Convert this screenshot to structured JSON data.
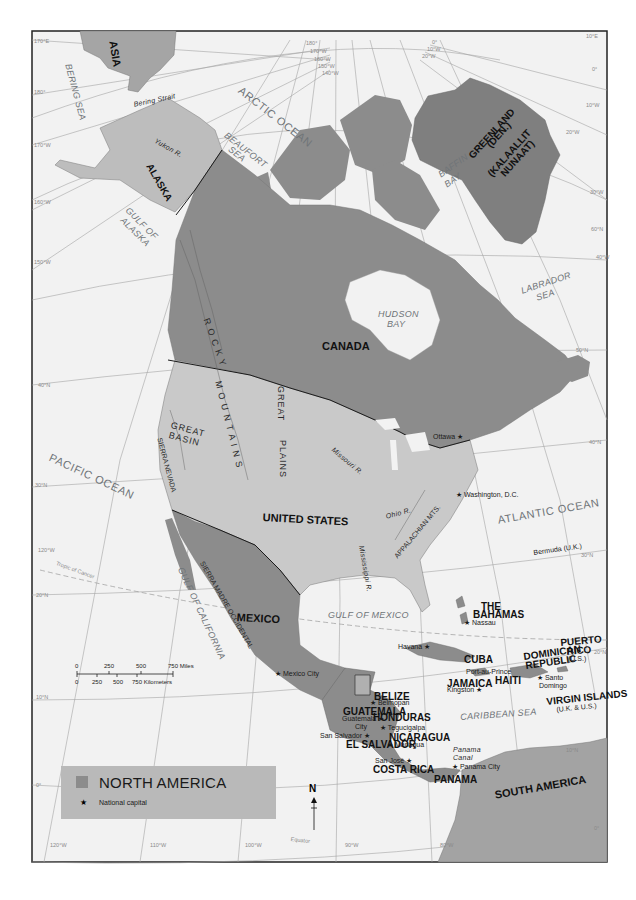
{
  "map": {
    "title": "NORTH AMERICA",
    "frame": {
      "x": 32,
      "y": 31,
      "width": 244,
      "height": 0
    },
    "colors": {
      "north_america": "#8c8c8c",
      "usa": "#c9c9c9",
      "alaska": "#bdbdbd",
      "greenland": "#7f7f7f",
      "asia": "#a5a5a5",
      "south_america": "#a3a3a3",
      "ocean": "#f2f2f2",
      "border": "#1a1a1a",
      "graticule": "#9a9a9a",
      "legend_bg": "#b9b9b9"
    }
  },
  "labels": {
    "countries": [
      {
        "id": "asia",
        "text": "ASIA",
        "x": 118,
        "y": 40,
        "rot": 80,
        "cls": "country big"
      },
      {
        "id": "alaska",
        "text": "ALASKA",
        "x": 153,
        "y": 162,
        "rot": 60,
        "cls": "country"
      },
      {
        "id": "greenland",
        "text": "GREENLAND",
        "x": 467,
        "y": 154,
        "rot": -48,
        "cls": "country"
      },
      {
        "id": "greenland-den",
        "text": "(DEN.)",
        "x": 485,
        "y": 143,
        "rot": -48,
        "cls": "country"
      },
      {
        "id": "kalaallit",
        "text": "(KALAALLIT",
        "x": 486,
        "y": 172,
        "rot": -48,
        "cls": "country"
      },
      {
        "id": "nunaat",
        "text": "NUNAAT)",
        "x": 499,
        "y": 172,
        "rot": -48,
        "cls": "country"
      },
      {
        "id": "canada",
        "text": "CANADA",
        "x": 322,
        "y": 341,
        "rot": 0,
        "cls": "country big"
      },
      {
        "id": "united-states",
        "text": "UNITED STATES",
        "x": 263,
        "y": 512,
        "rot": 3,
        "cls": "country big"
      },
      {
        "id": "mexico",
        "text": "MEXICO",
        "x": 237,
        "y": 612,
        "rot": 3,
        "cls": "country big"
      },
      {
        "id": "the-bahamas-1",
        "text": "THE",
        "x": 481,
        "y": 602,
        "rot": 0,
        "cls": "country"
      },
      {
        "id": "the-bahamas-2",
        "text": "BAHAMAS",
        "x": 473,
        "y": 610,
        "rot": 0,
        "cls": "country"
      },
      {
        "id": "cuba",
        "text": "CUBA",
        "x": 464,
        "y": 655,
        "rot": 0,
        "cls": "country"
      },
      {
        "id": "jamaica",
        "text": "JAMAICA",
        "x": 447,
        "y": 679,
        "rot": 0,
        "cls": "country"
      },
      {
        "id": "haiti",
        "text": "HAITI",
        "x": 495,
        "y": 676,
        "rot": 0,
        "cls": "country"
      },
      {
        "id": "dominican-republic-1",
        "text": "DOMINICAN",
        "x": 523,
        "y": 652,
        "rot": -8,
        "cls": "country"
      },
      {
        "id": "dominican-republic-2",
        "text": "REPUBLIC",
        "x": 525,
        "y": 661,
        "rot": -8,
        "cls": "country"
      },
      {
        "id": "puerto-rico-1",
        "text": "PUERTO",
        "x": 560,
        "y": 638,
        "rot": -5,
        "cls": "country"
      },
      {
        "id": "puerto-rico-2",
        "text": "RICO",
        "x": 566,
        "y": 647,
        "rot": -5,
        "cls": "country"
      },
      {
        "id": "virgin-islands",
        "text": "VIRGIN ISLANDS",
        "x": 546,
        "y": 697,
        "rot": -6,
        "cls": "country"
      },
      {
        "id": "belize",
        "text": "BELIZE",
        "x": 374,
        "y": 692,
        "rot": 0,
        "cls": "country"
      },
      {
        "id": "guatemala",
        "text": "GUATEMALA",
        "x": 343,
        "y": 707,
        "rot": 0,
        "cls": "country"
      },
      {
        "id": "honduras",
        "text": "HONDURAS",
        "x": 373,
        "y": 713,
        "rot": 0,
        "cls": "country"
      },
      {
        "id": "el-salvador",
        "text": "EL SALVADOR",
        "x": 346,
        "y": 740,
        "rot": 0,
        "cls": "country"
      },
      {
        "id": "nicaragua",
        "text": "NICARAGUA",
        "x": 389,
        "y": 733,
        "rot": 0,
        "cls": "country"
      },
      {
        "id": "costa-rica",
        "text": "COSTA RICA",
        "x": 373,
        "y": 765,
        "rot": 0,
        "cls": "country"
      },
      {
        "id": "panama",
        "text": "PANAMA",
        "x": 434,
        "y": 775,
        "rot": 0,
        "cls": "country"
      },
      {
        "id": "south-america",
        "text": "SOUTH AMERICA",
        "x": 494,
        "y": 790,
        "rot": -10,
        "cls": "country big"
      }
    ],
    "water": [
      {
        "id": "bering-sea",
        "text": "BERING SEA",
        "x": 72,
        "y": 63,
        "rot": 75,
        "cls": "ocean"
      },
      {
        "id": "bering-strait",
        "text": "Bering Strait",
        "x": 133,
        "y": 101,
        "rot": -12,
        "cls": "ocean feature-sm"
      },
      {
        "id": "arctic-ocean",
        "text": "ARCTIC OCEAN",
        "x": 243,
        "y": 85,
        "rot": 38,
        "cls": "ocean-big"
      },
      {
        "id": "beaufort-sea-1",
        "text": "BEAUFORT",
        "x": 228,
        "y": 131,
        "rot": 38,
        "cls": "ocean"
      },
      {
        "id": "beaufort-sea-2",
        "text": "SEA",
        "x": 232,
        "y": 145,
        "rot": 38,
        "cls": "ocean"
      },
      {
        "id": "gulf-of-alaska-1",
        "text": "GULF OF",
        "x": 130,
        "y": 206,
        "rot": 45,
        "cls": "ocean"
      },
      {
        "id": "gulf-of-alaska-2",
        "text": "ALASKA",
        "x": 125,
        "y": 216,
        "rot": 45,
        "cls": "ocean"
      },
      {
        "id": "baffin-bay-1",
        "text": "BAFFIN",
        "x": 437,
        "y": 172,
        "rot": -35,
        "cls": "ocean"
      },
      {
        "id": "baffin-bay-2",
        "text": "BAY",
        "x": 443,
        "y": 182,
        "rot": -35,
        "cls": "ocean"
      },
      {
        "id": "hudson-bay-1",
        "text": "HUDSON",
        "x": 378,
        "y": 310,
        "rot": 0,
        "cls": "ocean"
      },
      {
        "id": "hudson-bay-2",
        "text": "BAY",
        "x": 387,
        "y": 320,
        "rot": 0,
        "cls": "ocean"
      },
      {
        "id": "labrador-sea-1",
        "text": "LABRADOR",
        "x": 520,
        "y": 287,
        "rot": -18,
        "cls": "ocean"
      },
      {
        "id": "labrador-sea-2",
        "text": "SEA",
        "x": 535,
        "y": 294,
        "rot": -18,
        "cls": "ocean"
      },
      {
        "id": "pacific-ocean",
        "text": "PACIFIC OCEAN",
        "x": 52,
        "y": 452,
        "rot": 25,
        "cls": "ocean-big"
      },
      {
        "id": "atlantic-ocean",
        "text": "ATLANTIC OCEAN",
        "x": 497,
        "y": 515,
        "rot": -10,
        "cls": "ocean-big"
      },
      {
        "id": "gulf-of-mexico",
        "text": "GULF OF MEXICO",
        "x": 328,
        "y": 611,
        "rot": 0,
        "cls": "ocean"
      },
      {
        "id": "gulf-of-california",
        "text": "GULF OF CALIFORNIA",
        "x": 184,
        "y": 566,
        "rot": 65,
        "cls": "ocean"
      },
      {
        "id": "caribbean-sea",
        "text": "CARIBBEAN SEA",
        "x": 460,
        "y": 713,
        "rot": -4,
        "cls": "ocean"
      },
      {
        "id": "panama-canal-1",
        "text": "Panama",
        "x": 453,
        "y": 746,
        "rot": 0,
        "cls": "ocean feature-sm"
      },
      {
        "id": "panama-canal-2",
        "text": "Canal",
        "x": 453,
        "y": 754,
        "rot": 0,
        "cls": "ocean feature-sm"
      }
    ],
    "features": [
      {
        "id": "rocky-mountains-1",
        "text": "R O C K Y",
        "x": 210,
        "y": 317,
        "rot": 70,
        "cls": "feature"
      },
      {
        "id": "rocky-mountains-2",
        "text": "M O U N T A I N S",
        "x": 222,
        "y": 380,
        "rot": 76,
        "cls": "feature"
      },
      {
        "id": "great-plains-1",
        "text": "GREAT",
        "x": 285,
        "y": 386,
        "rot": 90,
        "cls": "feature"
      },
      {
        "id": "great-plains-2",
        "text": "PLAINS",
        "x": 287,
        "y": 440,
        "rot": 90,
        "cls": "feature"
      },
      {
        "id": "great-basin-1",
        "text": "GREAT",
        "x": 172,
        "y": 421,
        "rot": 15,
        "cls": "feature"
      },
      {
        "id": "great-basin-2",
        "text": "BASIN",
        "x": 170,
        "y": 431,
        "rot": 15,
        "cls": "feature"
      },
      {
        "id": "sierra-nevada",
        "text": "SIERRA NEVADA",
        "x": 163,
        "y": 437,
        "rot": 75,
        "cls": "feature-sm"
      },
      {
        "id": "sierra-madre",
        "text": "SIERRA MADRE OCCIDENTAL",
        "x": 205,
        "y": 560,
        "rot": 60,
        "cls": "feature-sm"
      },
      {
        "id": "appalachian",
        "text": "APPALACHIAN MTS.",
        "x": 393,
        "y": 555,
        "rot": -50,
        "cls": "feature-sm"
      },
      {
        "id": "ohio-river",
        "text": "Ohio R.",
        "x": 385,
        "y": 513,
        "rot": -15,
        "cls": "ocean feature-sm"
      },
      {
        "id": "missouri-river",
        "text": "Missouri R.",
        "x": 335,
        "y": 446,
        "rot": 40,
        "cls": "ocean feature-sm"
      },
      {
        "id": "mississippi-river",
        "text": "Mississippi R.",
        "x": 365,
        "y": 545,
        "rot": 80,
        "cls": "ocean feature-sm"
      },
      {
        "id": "yukon-river",
        "text": "Yukon R.",
        "x": 157,
        "y": 137,
        "rot": 30,
        "cls": "ocean feature-sm"
      },
      {
        "id": "tropic-of-cancer",
        "text": "Tropic of Cancer",
        "x": 57,
        "y": 561,
        "rot": 20,
        "cls": "grid"
      },
      {
        "id": "equator",
        "text": "Equator",
        "x": 291,
        "y": 837,
        "rot": 6,
        "cls": "grid"
      }
    ],
    "cities": [
      {
        "id": "ottawa",
        "text": "Ottawa ★",
        "x": 433,
        "y": 433,
        "rot": 0
      },
      {
        "id": "washington",
        "text": "★ Washington, D.C.",
        "x": 456,
        "y": 491,
        "rot": 0
      },
      {
        "id": "bermuda",
        "text": "Bermuda (U.K.)",
        "x": 533,
        "y": 549,
        "rot": -8
      },
      {
        "id": "nassau",
        "text": "★ Nassau",
        "x": 464,
        "y": 619,
        "rot": 0
      },
      {
        "id": "havana",
        "text": "Havana ★",
        "x": 398,
        "y": 643,
        "rot": 0
      },
      {
        "id": "port-au-prince",
        "text": "Port-au-Prince",
        "x": 466,
        "y": 668,
        "rot": 0
      },
      {
        "id": "kingston",
        "text": "Kingston ★",
        "x": 447,
        "y": 686,
        "rot": 0
      },
      {
        "id": "santo-domingo-1",
        "text": "★ Santo",
        "x": 537,
        "y": 674,
        "rot": 0
      },
      {
        "id": "santo-domingo-2",
        "text": "Domingo",
        "x": 539,
        "y": 682,
        "rot": 0
      },
      {
        "id": "puerto-rico-us",
        "text": "(U.S.)",
        "x": 568,
        "y": 655,
        "rot": 0
      },
      {
        "id": "virgin-islands-us",
        "text": "(U.K. & U.S.)",
        "x": 556,
        "y": 706,
        "rot": -6
      },
      {
        "id": "mexico-city",
        "text": "★ Mexico City",
        "x": 275,
        "y": 670,
        "rot": 0
      },
      {
        "id": "belmopan",
        "text": "★ Belmopan",
        "x": 370,
        "y": 699,
        "rot": 0
      },
      {
        "id": "guatemala-city-1",
        "text": "Guatemala ★",
        "x": 342,
        "y": 715,
        "rot": 0
      },
      {
        "id": "guatemala-city-2",
        "text": "City",
        "x": 355,
        "y": 723,
        "rot": 0
      },
      {
        "id": "tegucigalpa",
        "text": "★ Tegucigalpa",
        "x": 380,
        "y": 724,
        "rot": 0
      },
      {
        "id": "san-salvador",
        "text": "San Salvador ★",
        "x": 320,
        "y": 732,
        "rot": 0
      },
      {
        "id": "managua",
        "text": "★ Managua",
        "x": 387,
        "y": 741,
        "rot": 0
      },
      {
        "id": "san-jose",
        "text": "San José ★",
        "x": 375,
        "y": 757,
        "rot": 0
      },
      {
        "id": "panama-city",
        "text": "★ Panama City",
        "x": 452,
        "y": 763,
        "rot": 0
      }
    ],
    "graticule_marks": [
      {
        "text": "170°E",
        "x": 34,
        "y": 39
      },
      {
        "text": "180°",
        "x": 34,
        "y": 90
      },
      {
        "text": "170°W",
        "x": 34,
        "y": 143
      },
      {
        "text": "160°W",
        "x": 34,
        "y": 200
      },
      {
        "text": "150°W",
        "x": 34,
        "y": 260
      },
      {
        "text": "40°N",
        "x": 38,
        "y": 383
      },
      {
        "text": "30°N",
        "x": 35,
        "y": 483
      },
      {
        "text": "120°W",
        "x": 38,
        "y": 548
      },
      {
        "text": "20°N",
        "x": 36,
        "y": 593
      },
      {
        "text": "10°N",
        "x": 36,
        "y": 695
      },
      {
        "text": "0°",
        "x": 36,
        "y": 783
      },
      {
        "text": "120°W",
        "x": 50,
        "y": 843
      },
      {
        "text": "110°W",
        "x": 150,
        "y": 843
      },
      {
        "text": "100°W",
        "x": 245,
        "y": 843
      },
      {
        "text": "90°W",
        "x": 345,
        "y": 843
      },
      {
        "text": "80°W",
        "x": 440,
        "y": 843
      },
      {
        "text": "180°",
        "x": 306,
        "y": 41
      },
      {
        "text": "170°W",
        "x": 310,
        "y": 49
      },
      {
        "text": "160°W",
        "x": 314,
        "y": 57
      },
      {
        "text": "150°W",
        "x": 318,
        "y": 64
      },
      {
        "text": "140°W",
        "x": 322,
        "y": 71
      },
      {
        "text": "0°",
        "x": 432,
        "y": 40
      },
      {
        "text": "10°W",
        "x": 427,
        "y": 47
      },
      {
        "text": "20°W",
        "x": 422,
        "y": 54
      },
      {
        "text": "10°E",
        "x": 586,
        "y": 34
      },
      {
        "text": "0°",
        "x": 592,
        "y": 67
      },
      {
        "text": "10°W",
        "x": 586,
        "y": 103
      },
      {
        "text": "20°W",
        "x": 566,
        "y": 130
      },
      {
        "text": "30°W",
        "x": 590,
        "y": 190
      },
      {
        "text": "60°N",
        "x": 591,
        "y": 227
      },
      {
        "text": "40°W",
        "x": 596,
        "y": 255
      },
      {
        "text": "50°N",
        "x": 576,
        "y": 348
      },
      {
        "text": "40°N",
        "x": 589,
        "y": 440
      },
      {
        "text": "30°N",
        "x": 581,
        "y": 553
      },
      {
        "text": "20°N",
        "x": 594,
        "y": 650
      },
      {
        "text": "10°N",
        "x": 566,
        "y": 748
      },
      {
        "text": "0°",
        "x": 594,
        "y": 826
      }
    ]
  },
  "scale_bar": {
    "miles": [
      "0",
      "250",
      "500",
      "750 Miles"
    ],
    "kilometers": [
      "0",
      "250",
      "500",
      "750 Kilometers"
    ]
  },
  "legend": {
    "title": "NORTH AMERICA",
    "capital_symbol": "★",
    "capital_label": "National capital"
  },
  "compass": {
    "label": "N"
  }
}
